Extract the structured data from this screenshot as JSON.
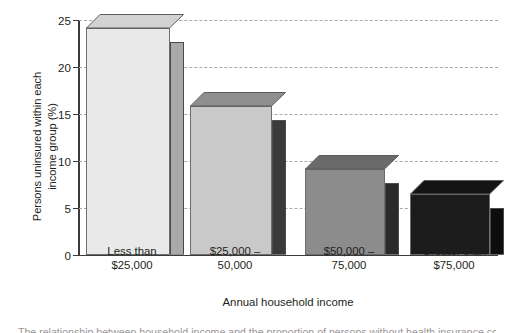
{
  "chart_data": {
    "type": "bar",
    "title": "",
    "subtitle": "",
    "xlabel": "Annual household income",
    "ylabel": "Persons uninsured within each\nincome group (%)",
    "categories": [
      "Less than\n$25,000",
      "$25,000 –\n50,000",
      "$50,000 –\n75,000",
      "Greater than\n$75,000"
    ],
    "values": [
      24.2,
      15.8,
      9.1,
      6.5
    ],
    "ylim": [
      0,
      25
    ],
    "yticks": [
      0,
      5,
      10,
      15,
      20,
      25
    ],
    "ytick_labels": [
      "0",
      "5",
      "10",
      "15",
      "20",
      "25"
    ],
    "grid": "horizontal-dashed",
    "legend": "none",
    "bar_style": "3d-extruded",
    "series": [
      {
        "name": "Persons uninsured within each income group (%)",
        "values": [
          24.2,
          15.8,
          9.1,
          6.5
        ]
      }
    ],
    "bar_colors": [
      {
        "front": "#e9e9e9",
        "side": "#a9a9a9",
        "top": "#d2d2d2"
      },
      {
        "front": "#c9c9c9",
        "side": "#3a3a3a",
        "top": "#8f8f8f"
      },
      {
        "front": "#8c8c8c",
        "side": "#2a2a2a",
        "top": "#6a6a6a"
      },
      {
        "front": "#1b1b1b",
        "side": "#0d0d0d",
        "top": "#141414"
      }
    ]
  },
  "axis": {
    "line_color": "#3b3b3b",
    "gridline_color": "#a9a9a9"
  },
  "caption": {
    "clipped_line": "The relationship between household income and the proportion of persons without health insurance coverage."
  }
}
